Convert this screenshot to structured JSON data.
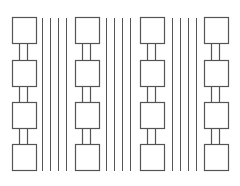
{
  "diagram": {
    "colors": {
      "background": "#ffffff",
      "stroke": "#555555"
    },
    "node_size": {
      "width": 24,
      "height": 26
    },
    "row_tops": [
      17,
      60,
      102,
      144
    ],
    "columns": [
      {
        "id": "column-1",
        "x": 12,
        "connector_x": [
          19,
          27
        ]
      },
      {
        "id": "column-2",
        "x": 75,
        "connector_x": [
          82,
          90
        ]
      },
      {
        "id": "column-3",
        "x": 140,
        "connector_x": [
          147,
          155
        ]
      },
      {
        "id": "column-4",
        "x": 204,
        "connector_x": [
          211,
          219
        ]
      }
    ],
    "separator_groups": [
      {
        "id": "separator-group-1",
        "lines_x": [
          42,
          50,
          58,
          66
        ]
      },
      {
        "id": "separator-group-2",
        "lines_x": [
          106,
          114,
          122,
          130
        ]
      },
      {
        "id": "separator-group-3",
        "lines_x": [
          172,
          180,
          188,
          196
        ]
      }
    ],
    "separator_y_range": [
      18,
      171
    ]
  }
}
